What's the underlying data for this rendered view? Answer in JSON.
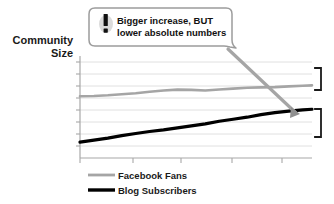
{
  "chart_data": {
    "type": "line",
    "title": "",
    "ylabel_line1": "Community",
    "ylabel_line2": "Size",
    "xlabel": "",
    "grid": true,
    "grid_axis": "y",
    "legend_position": "bottom-left",
    "xlim": [
      0,
      10
    ],
    "ylim": [
      0,
      10
    ],
    "axis_tick_labels_x": [],
    "axis_tick_labels_y": [],
    "series": [
      {
        "name": "Facebook Fans",
        "color": "#a5a5a5",
        "width": 2.6,
        "x": [
          0,
          0.6,
          1.2,
          1.8,
          2.4,
          3.0,
          3.6,
          4.2,
          4.8,
          5.4,
          6.0,
          6.6,
          7.2,
          7.8,
          8.4,
          9.0,
          9.6,
          10
        ],
        "y": [
          6.05,
          6.08,
          6.15,
          6.25,
          6.35,
          6.5,
          6.62,
          6.7,
          6.68,
          6.62,
          6.72,
          6.8,
          6.88,
          6.92,
          6.95,
          7.02,
          7.08,
          7.12
        ]
      },
      {
        "name": "Blog Subscribers",
        "color": "#000000",
        "width": 3.2,
        "x": [
          0,
          0.6,
          1.2,
          1.8,
          2.4,
          3.0,
          3.6,
          4.2,
          4.8,
          5.4,
          6.0,
          6.6,
          7.2,
          7.8,
          8.4,
          9.0,
          9.6,
          10
        ],
        "y": [
          1.55,
          1.75,
          1.95,
          2.2,
          2.4,
          2.6,
          2.75,
          2.95,
          3.15,
          3.35,
          3.6,
          3.8,
          4.0,
          4.25,
          4.45,
          4.6,
          4.72,
          4.78
        ]
      }
    ],
    "annotations": [
      {
        "name": "callout",
        "line1": "Bigger increase, BUT",
        "line2": "lower absolute numbers",
        "icon": "exclamation-icon",
        "points_to": "Blog Subscribers end point"
      }
    ],
    "range_brackets": [
      {
        "name": "facebook-fans-range-bracket",
        "series": "Facebook Fans"
      },
      {
        "name": "blog-subscribers-range-bracket",
        "series": "Blog Subscribers"
      }
    ]
  },
  "axis": {
    "ylabel_line1": "Community",
    "ylabel_line2": "Size"
  },
  "callout": {
    "line1": "Bigger increase, BUT",
    "line2": "lower absolute numbers",
    "icon_glyph": "!"
  },
  "legend": {
    "items": [
      {
        "label": "Facebook Fans",
        "color": "#a5a5a5"
      },
      {
        "label": "Blog Subscribers",
        "color": "#000000"
      }
    ]
  },
  "colors": {
    "facebook_fans": "#a5a5a5",
    "blog_subscribers": "#000000",
    "grid": "#d8d8d8",
    "axis": "#b0b0b0",
    "callout_border": "#9a9a9a",
    "background": "#ffffff"
  }
}
